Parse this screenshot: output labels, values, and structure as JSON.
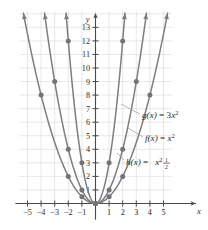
{
  "chart_data": {
    "type": "line",
    "title": "",
    "xlabel": "x",
    "ylabel": "y",
    "grid": true,
    "legend_position": "inline-right",
    "xlim": [
      -5.8,
      5.8
    ],
    "ylim": [
      -1.2,
      14.4
    ],
    "xticks": [
      -5,
      -4,
      -3,
      -2,
      -1,
      1,
      2,
      3,
      4,
      5
    ],
    "yticks": [
      1,
      2,
      3,
      4,
      5,
      6,
      7,
      8,
      9,
      10,
      11,
      12,
      13
    ],
    "xtick_labels": [
      "-5",
      "-4",
      "-3",
      "-2",
      "-1",
      "1",
      "2",
      "3",
      "4",
      "5"
    ],
    "ytick_labels": [
      "1",
      "2",
      "3",
      "4",
      "5",
      "6",
      "7",
      "8",
      "9",
      "10",
      "11",
      "12",
      "13"
    ],
    "series": [
      {
        "name": "g",
        "label_parts": {
          "fn": "g",
          "arg": "(x)",
          "eq": "=",
          "coef": "3",
          "var": "x",
          "exp": "2"
        },
        "equation": "g(x) = 3x^2",
        "coefficient": 3,
        "color": "#7d7d82",
        "points": [
          {
            "x": -2,
            "y": 12
          },
          {
            "x": -1,
            "y": 3
          },
          {
            "x": 0,
            "y": 0
          },
          {
            "x": 1,
            "y": 3
          },
          {
            "x": 2,
            "y": 12
          }
        ]
      },
      {
        "name": "f",
        "label_parts": {
          "fn": "f",
          "arg": "(x)",
          "eq": "=",
          "coef": "",
          "var": "x",
          "exp": "2"
        },
        "equation": "f(x) = x^2",
        "coefficient": 1,
        "color": "#7d7d82",
        "points": [
          {
            "x": -3,
            "y": 9
          },
          {
            "x": -2,
            "y": 4
          },
          {
            "x": -1,
            "y": 1
          },
          {
            "x": 0,
            "y": 0
          },
          {
            "x": 1,
            "y": 1
          },
          {
            "x": 2,
            "y": 4
          },
          {
            "x": 3,
            "y": 9
          }
        ]
      },
      {
        "name": "h",
        "label_parts": {
          "fn": "h",
          "arg": "(x)",
          "eq": "=",
          "num": "1",
          "den": "2",
          "var": "x",
          "exp": "2"
        },
        "equation": "h(x) = 1/2 x^2",
        "coefficient": 0.5,
        "color": "#7d7d82",
        "points": [
          {
            "x": -4,
            "y": 8
          },
          {
            "x": -2,
            "y": 2
          },
          {
            "x": -1,
            "y": 0.5
          },
          {
            "x": 0,
            "y": 0
          },
          {
            "x": 1,
            "y": 0.5
          },
          {
            "x": 2,
            "y": 2
          },
          {
            "x": 4,
            "y": 8
          }
        ]
      }
    ],
    "annotations": [
      {
        "for": "g",
        "text": "g(x) = 3x^2"
      },
      {
        "for": "f",
        "text": "f(x) = x^2"
      },
      {
        "for": "h",
        "text": "h(x) = 1/2 x^2"
      }
    ]
  }
}
